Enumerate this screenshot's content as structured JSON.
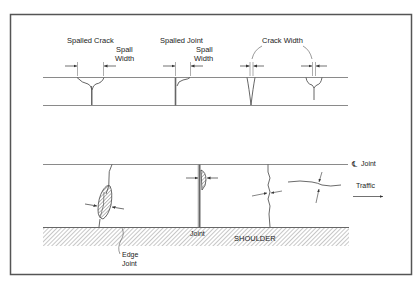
{
  "figure": {
    "colors": {
      "frame": "#555555",
      "line": "#8a8a8a",
      "ink": "#333333",
      "hatch": "#9a9a9a"
    }
  },
  "profile_view": {
    "labels": {
      "spalled_crack": "Spalled Crack",
      "spall_width_1_line1": "Spall",
      "spall_width_1_line2": "Width",
      "spalled_joint": "Spalled Joint",
      "spall_width_2_line1": "Spall",
      "spall_width_2_line2": "Width",
      "crack_width": "Crack Width"
    }
  },
  "plan_view": {
    "labels": {
      "centerline_symbol": "℄",
      "centerline_joint": "Joint",
      "traffic": "Traffic",
      "joint": "Joint",
      "shoulder": "SHOULDER",
      "edge_joint_line1": "Edge",
      "edge_joint_line2": "Joint"
    }
  }
}
